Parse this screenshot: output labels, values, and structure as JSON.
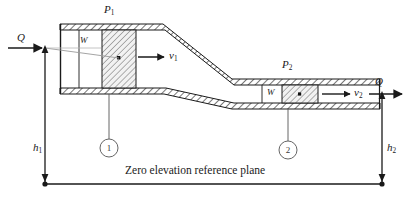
{
  "figure": {
    "title_caption": "",
    "labels": {
      "pressure_1": "P",
      "pressure_1_sub": "1",
      "pressure_2": "P",
      "pressure_2_sub": "2",
      "flow_in": "Q",
      "flow_out": "Q",
      "velocity_1": "v",
      "velocity_1_sub": "1",
      "velocity_2": "v",
      "velocity_2_sub": "2",
      "weight_1": "W",
      "weight_2": "W",
      "height_1": "h",
      "height_1_sub": "1",
      "height_2": "h",
      "height_2_sub": "2",
      "station_1": "1",
      "station_2": "2",
      "datum_text": "Zero elevation reference plane"
    },
    "colors": {
      "line": "#1a1a1a",
      "hatch": "#555555",
      "fill": "#ffffff",
      "slug_fill": "#e8e8e8",
      "text": "#1a1a1a",
      "muted": "#3a3a3a"
    },
    "geometry": {
      "left_pipe": {
        "x": 60,
        "y_top": 24,
        "y_bot": 88,
        "x_end": 163
      },
      "right_pipe": {
        "x_start": 232,
        "y_top": 79,
        "y_bot": 103,
        "x_end": 380
      },
      "datum_y": 184,
      "datum_x_left": 45,
      "datum_x_right": 382,
      "wall_thickness": 6
    }
  }
}
